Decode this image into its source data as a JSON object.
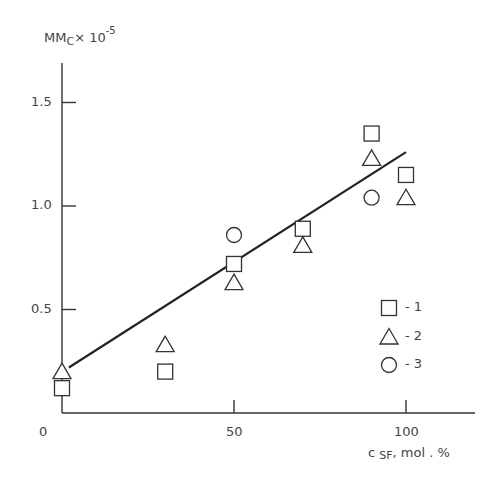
{
  "chart_data": {
    "type": "scatter",
    "title": "",
    "ylabel": "MMc× 10⁻⁵",
    "ylabel_main": "MM",
    "ylabel_sub": "C",
    "ylabel_mult": "× 10",
    "ylabel_exp": "-5",
    "xlabel": "c SF, mol . %",
    "xlabel_prefix": "c",
    "xlabel_sub": "SF",
    "xlabel_suffix": ", mol . %",
    "xlim": [
      0,
      120
    ],
    "ylim": [
      0,
      1.8
    ],
    "x_ticks": [
      {
        "value": 0,
        "label": "0"
      },
      {
        "value": 50,
        "label": "50"
      },
      {
        "value": 100,
        "label": "100"
      }
    ],
    "y_ticks": [
      {
        "value": 0.5,
        "label": "0.5"
      },
      {
        "value": 1.0,
        "label": "1.0"
      },
      {
        "value": 1.5,
        "label": "1.5"
      }
    ],
    "grid": false,
    "legend_position": "lower right",
    "series": [
      {
        "name": "1",
        "marker": "square",
        "points": [
          [
            0,
            0.12
          ],
          [
            30,
            0.2
          ],
          [
            50,
            0.72
          ],
          [
            70,
            0.89
          ],
          [
            90,
            1.35
          ],
          [
            100,
            1.15
          ]
        ]
      },
      {
        "name": "2",
        "marker": "triangle",
        "points": [
          [
            0,
            0.2
          ],
          [
            30,
            0.33
          ],
          [
            50,
            0.63
          ],
          [
            70,
            0.81
          ],
          [
            90,
            1.23
          ],
          [
            100,
            1.04
          ]
        ]
      },
      {
        "name": "3",
        "marker": "circle",
        "points": [
          [
            50,
            0.86
          ],
          [
            90,
            1.04
          ]
        ]
      }
    ],
    "fit_line": {
      "x": [
        2,
        100
      ],
      "y": [
        0.22,
        1.26
      ]
    }
  },
  "legend": [
    {
      "marker": "square",
      "label": "- 1"
    },
    {
      "marker": "triangle",
      "label": "- 2"
    },
    {
      "marker": "circle",
      "label": "- 3"
    }
  ]
}
